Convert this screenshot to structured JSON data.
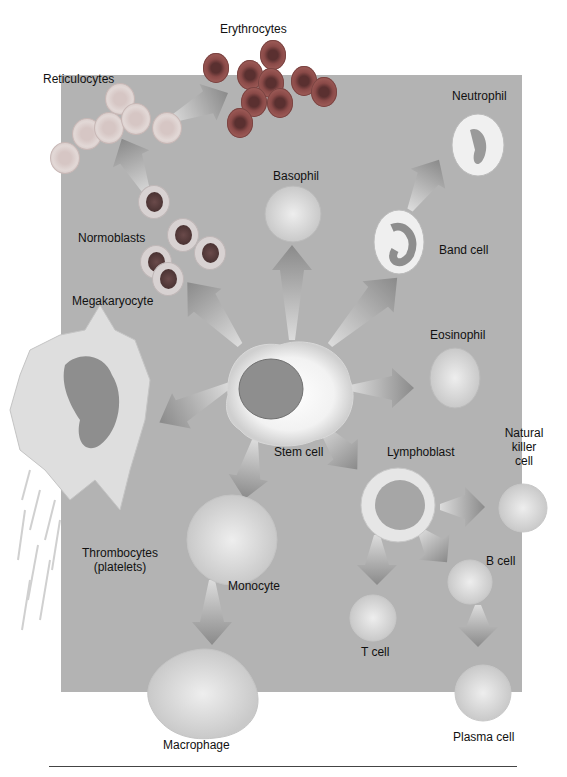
{
  "diagram": {
    "center": {
      "label": "Stem cell"
    },
    "cells": [
      {
        "id": "erythrocytes",
        "label": "Erythrocytes"
      },
      {
        "id": "reticulocytes",
        "label": "Reticulocytes"
      },
      {
        "id": "normoblasts",
        "label": "Normoblasts"
      },
      {
        "id": "megakaryocyte",
        "label": "Megakaryocyte"
      },
      {
        "id": "thrombocytes",
        "label_line1": "Thrombocytes",
        "label_line2": "(platelets)"
      },
      {
        "id": "basophil",
        "label": "Basophil"
      },
      {
        "id": "neutrophil",
        "label": "Neutrophil"
      },
      {
        "id": "band-cell",
        "label": "Band cell"
      },
      {
        "id": "eosinophil",
        "label": "Eosinophil"
      },
      {
        "id": "lymphoblast",
        "label": "Lymphoblast"
      },
      {
        "id": "natural-killer-cell",
        "label_line1": "Natural",
        "label_line2": "killer",
        "label_line3": "cell"
      },
      {
        "id": "b-cell",
        "label": "B cell"
      },
      {
        "id": "plasma-cell",
        "label": "Plasma cell"
      },
      {
        "id": "t-cell",
        "label": "T cell"
      },
      {
        "id": "monocyte",
        "label": "Monocyte"
      },
      {
        "id": "macrophage",
        "label": "Macrophage"
      }
    ],
    "edges": [
      [
        "Stem cell",
        "Normoblasts"
      ],
      [
        "Normoblasts",
        "Reticulocytes"
      ],
      [
        "Reticulocytes",
        "Erythrocytes"
      ],
      [
        "Stem cell",
        "Basophil"
      ],
      [
        "Stem cell",
        "Band cell"
      ],
      [
        "Band cell",
        "Neutrophil"
      ],
      [
        "Stem cell",
        "Eosinophil"
      ],
      [
        "Stem cell",
        "Megakaryocyte"
      ],
      [
        "Megakaryocyte",
        "Thrombocytes (platelets)"
      ],
      [
        "Stem cell",
        "Lymphoblast"
      ],
      [
        "Lymphoblast",
        "Natural killer cell"
      ],
      [
        "Lymphoblast",
        "B cell"
      ],
      [
        "B cell",
        "Plasma cell"
      ],
      [
        "Lymphoblast",
        "T cell"
      ],
      [
        "Stem cell",
        "Monocyte"
      ],
      [
        "Monocyte",
        "Macrophage"
      ]
    ],
    "colors": {
      "panel": "#b3b3b3",
      "background": "#ffffff",
      "arrow": "#8f8f8f",
      "erythrocyte": "#8a4a48",
      "cell_light": "#e6e6e6"
    }
  }
}
